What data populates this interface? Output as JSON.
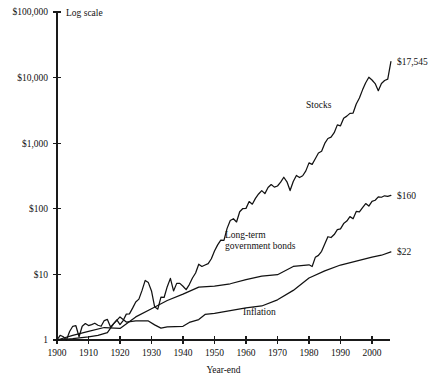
{
  "chart_data": {
    "type": "line",
    "title": "",
    "xlabel": "Year-end",
    "ylabel": "",
    "scale_note": "Log scale",
    "yscale": "log",
    "ylim": [
      1,
      100000
    ],
    "xlim": [
      1900,
      2006
    ],
    "grid": false,
    "legend_position": "inline-annotations",
    "ytick_labels": [
      "1",
      "$10",
      "$100",
      "$1,000",
      "$10,000",
      "$100,000"
    ],
    "ytick_values": [
      1,
      10,
      100,
      1000,
      10000,
      100000
    ],
    "xtick_labels": [
      "1900",
      "1910",
      "1920",
      "1930",
      "1940",
      "1950",
      "1960",
      "1970",
      "1980",
      "1990",
      "2000"
    ],
    "xtick_values": [
      1900,
      1910,
      1920,
      1930,
      1940,
      1950,
      1960,
      1970,
      1980,
      1990,
      2000
    ],
    "series": [
      {
        "name": "Stocks",
        "label": "Stocks",
        "end_label": "$17,545",
        "end_value": 17545,
        "x": [
          1900,
          1901,
          1902,
          1903,
          1904,
          1905,
          1906,
          1907,
          1908,
          1909,
          1910,
          1911,
          1912,
          1913,
          1914,
          1915,
          1916,
          1917,
          1918,
          1919,
          1920,
          1921,
          1922,
          1923,
          1924,
          1925,
          1926,
          1927,
          1928,
          1929,
          1930,
          1931,
          1932,
          1933,
          1934,
          1935,
          1936,
          1937,
          1938,
          1939,
          1940,
          1941,
          1942,
          1943,
          1944,
          1945,
          1946,
          1947,
          1948,
          1949,
          1950,
          1951,
          1952,
          1953,
          1954,
          1955,
          1956,
          1957,
          1958,
          1959,
          1960,
          1961,
          1962,
          1963,
          1964,
          1965,
          1966,
          1967,
          1968,
          1969,
          1970,
          1971,
          1972,
          1973,
          1974,
          1975,
          1976,
          1977,
          1978,
          1979,
          1980,
          1981,
          1982,
          1983,
          1984,
          1985,
          1986,
          1987,
          1988,
          1989,
          1990,
          1991,
          1992,
          1993,
          1994,
          1995,
          1996,
          1997,
          1998,
          1999,
          2000,
          2001,
          2002,
          2003,
          2004,
          2005,
          2006
        ],
        "values": [
          1,
          1.18,
          1.12,
          1.0,
          1.35,
          1.62,
          1.65,
          1.12,
          1.62,
          1.78,
          1.66,
          1.72,
          1.8,
          1.68,
          1.62,
          1.98,
          2.06,
          1.58,
          1.78,
          2.02,
          1.72,
          1.98,
          2.48,
          2.5,
          3.06,
          3.8,
          4.2,
          5.7,
          8.1,
          7.5,
          5.6,
          3.2,
          2.95,
          4.5,
          4.45,
          6.5,
          8.7,
          5.6,
          7.3,
          7.3,
          6.6,
          5.85,
          7.0,
          8.8,
          10.5,
          14.3,
          13.2,
          13.9,
          14.6,
          17.3,
          22.7,
          28.2,
          33.4,
          33.0,
          50.3,
          66.2,
          70.6,
          63.0,
          90.3,
          101.0,
          101.5,
          128.8,
          117.5,
          144.4,
          168.2,
          189.3,
          170.2,
          211.0,
          234.0,
          214.0,
          222.5,
          254.5,
          302.7,
          258.2,
          189.8,
          260.5,
          322.7,
          299.7,
          319.3,
          378.3,
          501.0,
          476.5,
          579.0,
          709.5,
          754.0,
          993.0,
          1178.0,
          1240.0,
          1445.0,
          1902.0,
          1843.0,
          2404.0,
          2587.0,
          2847.0,
          2884.0,
          3967.0,
          4877.0,
          6504.0,
          8362.0,
          10120.0,
          9199.0,
          8108.0,
          6318.0,
          8129.0,
          9015.0,
          9457.0,
          17545.0
        ]
      },
      {
        "name": "Long-term government bonds",
        "label": "Long-term\ngovernment bonds",
        "label_lines": [
          "Long-term",
          "government bonds"
        ],
        "end_label": "$160",
        "end_value": 160,
        "x": [
          1900,
          1905,
          1910,
          1915,
          1920,
          1925,
          1930,
          1935,
          1940,
          1945,
          1950,
          1955,
          1960,
          1965,
          1970,
          1975,
          1980,
          1981,
          1982,
          1983,
          1984,
          1985,
          1986,
          1987,
          1988,
          1989,
          1990,
          1991,
          1992,
          1993,
          1994,
          1995,
          1996,
          1997,
          1998,
          1999,
          2000,
          2001,
          2002,
          2003,
          2004,
          2005,
          2006
        ],
        "values": [
          1,
          1.18,
          1.35,
          1.55,
          1.5,
          2.25,
          3.0,
          4.0,
          5.0,
          6.4,
          6.6,
          7.2,
          8.3,
          9.4,
          9.9,
          13.2,
          14.0,
          13.2,
          18.2,
          19.5,
          22.5,
          29.0,
          37.5,
          36.5,
          40.5,
          48.0,
          49.5,
          59.5,
          65.0,
          76.0,
          70.5,
          91.0,
          89.5,
          104.0,
          120.0,
          110.0,
          130.0,
          135.0,
          152.0,
          150.0,
          158.0,
          155.0,
          160.0
        ]
      },
      {
        "name": "Inflation",
        "label": "Inflation",
        "end_label": "$22",
        "end_value": 22,
        "x": [
          1900,
          1905,
          1910,
          1913,
          1916,
          1918,
          1920,
          1922,
          1925,
          1929,
          1931,
          1933,
          1935,
          1940,
          1942,
          1945,
          1947,
          1950,
          1955,
          1960,
          1965,
          1970,
          1975,
          1980,
          1985,
          1990,
          1995,
          2000,
          2003,
          2006
        ],
        "values": [
          1,
          1.05,
          1.12,
          1.18,
          1.3,
          1.78,
          2.25,
          1.88,
          1.95,
          1.95,
          1.7,
          1.52,
          1.58,
          1.62,
          1.85,
          2.05,
          2.45,
          2.55,
          2.8,
          3.1,
          3.3,
          4.1,
          5.7,
          8.8,
          11.3,
          13.9,
          15.9,
          18.3,
          19.6,
          22.0
        ]
      }
    ],
    "annotations": [
      {
        "text": "Log scale",
        "role": "scale-note"
      },
      {
        "text": "Year-end",
        "role": "x-axis-title"
      }
    ]
  }
}
